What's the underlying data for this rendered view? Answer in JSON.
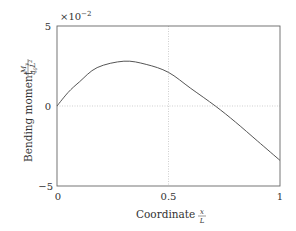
{
  "chart_data": {
    "type": "line",
    "title": "",
    "xlabel": "Coordinate x/L",
    "ylabel": "Bending moment M_y/(q_0 L^2)",
    "xlim": [
      0,
      1
    ],
    "ylim": [
      -0.05,
      0.05
    ],
    "y_scale_note": "×10^-2",
    "x_ticks": [
      "0",
      "0.5",
      "1"
    ],
    "y_ticks": [
      "−5",
      "0",
      "5"
    ],
    "grid": "dotted at x=0.5 and y=0",
    "legend": null,
    "series": [
      {
        "name": "M_y/(q_0 L^2)",
        "color": "#555555",
        "x": [
          0,
          0.05,
          0.1,
          0.18,
          0.3,
          0.4,
          0.5,
          0.6,
          0.71,
          0.8,
          0.9,
          1.0
        ],
        "y": [
          0,
          0.0085,
          0.015,
          0.024,
          0.028,
          0.026,
          0.021,
          0.011,
          0,
          -0.01,
          -0.022,
          -0.034
        ]
      }
    ]
  },
  "labels": {
    "exponent_times": "×10",
    "exponent_power": "−2",
    "y_tick_top": "5",
    "y_tick_mid": "0",
    "y_tick_bottom": "−5",
    "x_tick_left": "0",
    "x_tick_mid": "0.5",
    "x_tick_right": "1",
    "ylabel_text": "Bending moment",
    "ylabel_num": "M",
    "ylabel_num_sub": "y",
    "ylabel_den": "q",
    "ylabel_den_sub": "0",
    "ylabel_den_L": "L",
    "ylabel_den_pow": "2",
    "xlabel_text": "Coordinate",
    "xlabel_num": "x",
    "xlabel_den": "L"
  }
}
